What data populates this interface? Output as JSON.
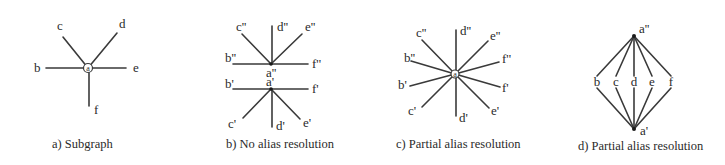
{
  "figure": {
    "panels": [
      {
        "id": "a",
        "caption": "a) Subgraph",
        "center_label": "a",
        "nodes": [
          "b",
          "c",
          "d",
          "e",
          "f"
        ]
      },
      {
        "id": "b",
        "caption": "b) No alias resolution",
        "upper_center_label": "a''",
        "lower_center_label": "a'",
        "upper_nodes": [
          "b''",
          "c''",
          "d''",
          "e''",
          "f''"
        ],
        "lower_nodes": [
          "b'",
          "c'",
          "d'",
          "e'",
          "f'"
        ]
      },
      {
        "id": "c",
        "caption": "c) Partial alias resolution",
        "center_label": "a",
        "nodes": [
          "c''",
          "d''",
          "e''",
          "b''",
          "f''",
          "b'",
          "f'",
          "c'",
          "d'",
          "e'"
        ]
      },
      {
        "id": "d",
        "caption": "d) Partial alias resolution",
        "top_label": "a''",
        "bottom_label": "a'",
        "middle_nodes": [
          "b",
          "c",
          "d",
          "e",
          "f"
        ]
      }
    ]
  }
}
